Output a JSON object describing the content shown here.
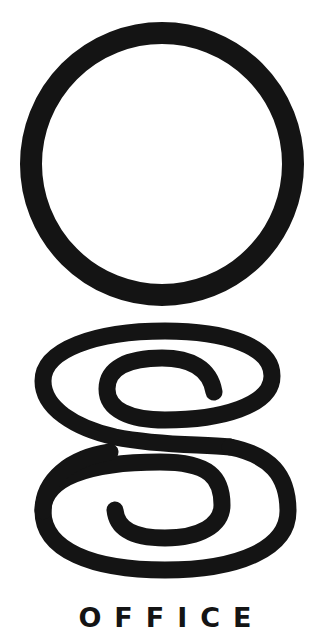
{
  "logo": {
    "mark_top": "circle",
    "mark_bottom": "spiral-g",
    "wordmark": "OFFICE",
    "ink_color": "#141414",
    "background": "#ffffff"
  }
}
